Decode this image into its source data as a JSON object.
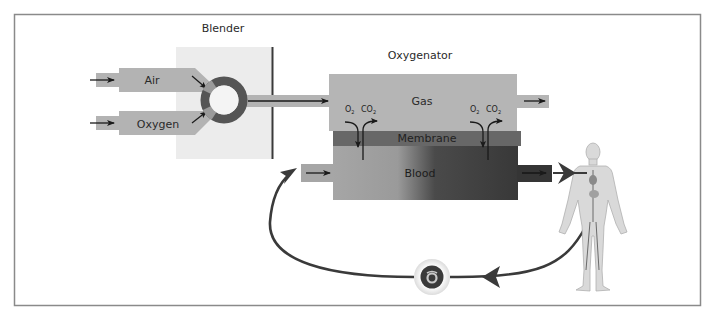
{
  "diagram": {
    "type": "ECMO circuit schematic",
    "labels": {
      "blender": "Blender",
      "oxygenator": "Oxygenator",
      "air": "Air",
      "oxygen": "Oxygen",
      "gas": "Gas",
      "membrane": "Membrane",
      "blood": "Blood"
    },
    "gas_exchange": [
      {
        "o2": "O",
        "o2_sub": "2",
        "co2": "CO",
        "co2_sub": "2"
      },
      {
        "o2": "O",
        "o2_sub": "2",
        "co2": "CO",
        "co2_sub": "2"
      }
    ],
    "components": [
      {
        "id": "air-inlet",
        "label": "Air"
      },
      {
        "id": "oxygen-inlet",
        "label": "Oxygen"
      },
      {
        "id": "blender",
        "label": "Blender"
      },
      {
        "id": "oxygenator",
        "label": "Oxygenator",
        "layers": [
          "Gas",
          "Membrane",
          "Blood"
        ]
      },
      {
        "id": "patient",
        "label": ""
      },
      {
        "id": "pump",
        "label": ""
      }
    ],
    "flows": [
      {
        "from": "Air",
        "to": "Blender"
      },
      {
        "from": "Oxygen",
        "to": "Blender"
      },
      {
        "from": "Blender",
        "to": "Oxygenator Gas"
      },
      {
        "from": "Oxygenator Blood",
        "to": "Patient"
      },
      {
        "from": "Patient",
        "to": "Pump"
      },
      {
        "from": "Pump",
        "to": "Oxygenator Blood"
      }
    ],
    "colors": {
      "frame": "#8a8a8a",
      "pipe": "#b3b3b3",
      "blender_panel": "#ececec",
      "ring": "#555555",
      "gas": "#b5b5b5",
      "membrane": "#666666",
      "blood_light": "#a5a5a5",
      "blood_dark": "#3a3a3a",
      "tube": "#3c3c3c",
      "arrow": "#1a1a1a"
    }
  }
}
